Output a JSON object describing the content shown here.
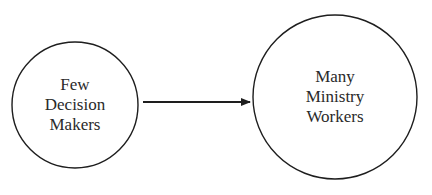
{
  "nodes": {
    "source": {
      "lines": [
        "Few",
        "Decision",
        "Makers"
      ]
    },
    "target": {
      "lines": [
        "Many",
        "Ministry",
        "Workers"
      ]
    }
  },
  "edge": {
    "from": "source",
    "to": "target",
    "style": "arrow"
  },
  "colors": {
    "stroke": "#1e1e1e",
    "text": "#2a2a2a",
    "background": "#ffffff"
  }
}
